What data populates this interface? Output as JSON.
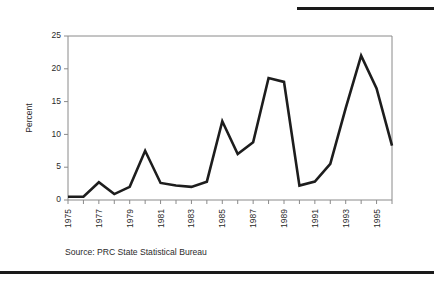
{
  "figure": {
    "source_note": "Source: PRC State Statistical Bureau",
    "rule_color": "#1a1a1a",
    "axis_color": "#8a8a8a",
    "line_color": "#1d1d1d"
  },
  "chart_data": {
    "type": "line",
    "title": "",
    "xlabel": "",
    "ylabel": "Percent",
    "ylim": [
      0,
      25
    ],
    "yticks": [
      0,
      5,
      10,
      15,
      20,
      25
    ],
    "ytick_labels": [
      "0",
      "5",
      "10",
      "15",
      "20",
      "25"
    ],
    "grid": false,
    "legend": "none",
    "x": [
      1975,
      1976,
      1977,
      1978,
      1979,
      1980,
      1981,
      1982,
      1983,
      1984,
      1985,
      1986,
      1987,
      1988,
      1989,
      1990,
      1991,
      1992,
      1993,
      1994,
      1995,
      1996
    ],
    "xtick_labels": [
      "1975",
      "1977",
      "1979",
      "1981",
      "1983",
      "1985",
      "1987",
      "1989",
      "1991",
      "1993",
      "1995"
    ],
    "xtick_values": [
      1975,
      1977,
      1979,
      1981,
      1983,
      1985,
      1987,
      1989,
      1991,
      1993,
      1995
    ],
    "values": [
      0.5,
      0.5,
      2.7,
      0.9,
      2.0,
      7.5,
      2.6,
      2.2,
      2.0,
      2.8,
      12.0,
      7.0,
      8.8,
      18.6,
      18.0,
      2.2,
      2.8,
      5.5,
      14.0,
      22.0,
      17.0,
      8.3
    ],
    "series": [
      {
        "name": "Percent",
        "values": [
          0.5,
          0.5,
          2.7,
          0.9,
          2.0,
          7.5,
          2.6,
          2.2,
          2.0,
          2.8,
          12.0,
          7.0,
          8.8,
          18.6,
          18.0,
          2.2,
          2.8,
          5.5,
          14.0,
          22.0,
          17.0,
          8.3
        ]
      }
    ]
  }
}
